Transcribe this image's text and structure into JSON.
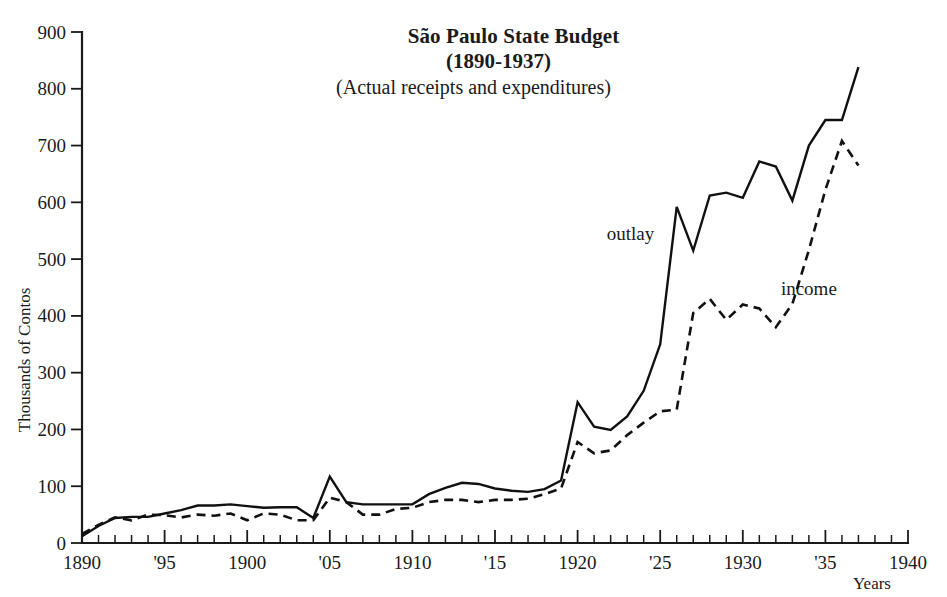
{
  "chart_data": {
    "type": "line",
    "title": "São Paulo State Budget",
    "subtitle": "(1890-1937)",
    "subtitle2": "(Actual receipts and expenditures)",
    "xlabel": "Years",
    "ylabel": "Thousands of Contos",
    "xlim": [
      1890,
      1940
    ],
    "ylim": [
      0,
      900
    ],
    "grid": false,
    "legend_position": "inline-annotations",
    "x_tick_labels": [
      "1890",
      "'95",
      "1900",
      "'05",
      "1910",
      "'15",
      "1920",
      "'25",
      "1930",
      "'35",
      "1940"
    ],
    "x_tick_values": [
      1890,
      1895,
      1900,
      1905,
      1910,
      1915,
      1920,
      1925,
      1930,
      1935,
      1940
    ],
    "x_minor_step": 1,
    "y_tick_labels": [
      "0",
      "100",
      "200",
      "300",
      "400",
      "500",
      "600",
      "700",
      "800",
      "900"
    ],
    "y_tick_values": [
      0,
      100,
      200,
      300,
      400,
      500,
      600,
      700,
      800,
      900
    ],
    "x": [
      1890,
      1891,
      1892,
      1893,
      1894,
      1895,
      1896,
      1897,
      1898,
      1899,
      1900,
      1901,
      1902,
      1903,
      1904,
      1905,
      1906,
      1907,
      1908,
      1909,
      1910,
      1911,
      1912,
      1913,
      1914,
      1915,
      1916,
      1917,
      1918,
      1919,
      1920,
      1921,
      1922,
      1923,
      1924,
      1925,
      1926,
      1927,
      1928,
      1929,
      1930,
      1931,
      1932,
      1933,
      1934,
      1935,
      1936,
      1937
    ],
    "series": [
      {
        "name": "outlay",
        "style": "solid",
        "label_x": 1923.2,
        "label_y": 533,
        "values": [
          12,
          30,
          44,
          46,
          46,
          52,
          58,
          66,
          66,
          68,
          65,
          62,
          63,
          63,
          44,
          117,
          72,
          68,
          68,
          68,
          68,
          86,
          97,
          106,
          104,
          96,
          92,
          90,
          95,
          110,
          248,
          205,
          199,
          223,
          268,
          350,
          592,
          515,
          612,
          617,
          608,
          672,
          663,
          603,
          700,
          745,
          745,
          838
        ]
      },
      {
        "name": "income",
        "style": "dashed",
        "label_x": 1934.0,
        "label_y": 437,
        "values": [
          16,
          32,
          45,
          40,
          50,
          49,
          45,
          50,
          48,
          52,
          40,
          52,
          50,
          40,
          40,
          80,
          72,
          50,
          50,
          60,
          62,
          72,
          76,
          76,
          72,
          76,
          76,
          78,
          86,
          96,
          178,
          158,
          163,
          190,
          212,
          232,
          235,
          405,
          430,
          393,
          420,
          413,
          380,
          421,
          516,
          622,
          708,
          665
        ]
      }
    ]
  },
  "annotations": {
    "outlay_label": "outlay",
    "income_label": "income"
  }
}
